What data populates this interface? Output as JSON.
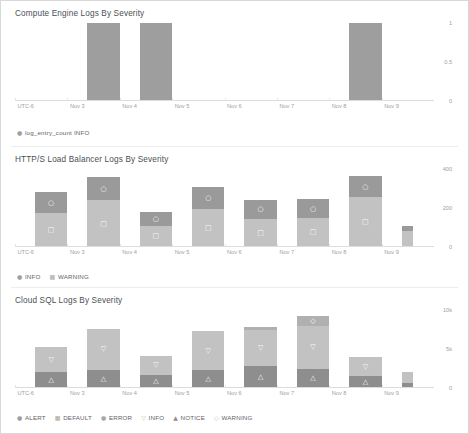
{
  "panels": [
    {
      "title": "Compute Engine Logs By Severity",
      "legend": [
        {
          "label": "log_entry_count INFO",
          "glyph": "●",
          "color": "#9e9e9e"
        }
      ],
      "chart_data": {
        "type": "bar",
        "title": "Compute Engine Logs By Severity",
        "xlabel": "",
        "ylabel": "",
        "grid": false,
        "legend_position": "bottom-left",
        "stacked": false,
        "categories": [
          "UTC-6",
          "Nov 3",
          "Nov 4",
          "Nov 5",
          "Nov 6",
          "Nov 7",
          "Nov 8",
          "Nov 9"
        ],
        "xticklabels": [
          "UTC-6",
          "Nov 3",
          "Nov 4",
          "Nov 5",
          "Nov 6",
          "Nov 7",
          "Nov 8",
          "Nov 9"
        ],
        "yticklabels": [
          "1",
          "0.5",
          "0"
        ],
        "ylim": [
          0,
          1
        ],
        "series": [
          {
            "name": "log_entry_count INFO",
            "color": "#9e9e9e",
            "values": [
              0,
              1,
              1,
              0,
              0,
              0,
              1,
              0
            ]
          }
        ]
      }
    },
    {
      "title": "HTTP/S Load Balancer Logs By Severity",
      "legend": [
        {
          "label": "INFO",
          "glyph": "●",
          "color": "#9e9e9e"
        },
        {
          "label": "WARNING",
          "glyph": "■",
          "color": "#bdbdbd"
        }
      ],
      "chart_data": {
        "type": "bar",
        "title": "HTTP/S Load Balancer Logs By Severity",
        "xlabel": "",
        "ylabel": "",
        "grid": false,
        "stacked": true,
        "legend_position": "bottom-left",
        "categories": [
          "UTC-6",
          "Nov 3",
          "Nov 4",
          "Nov 5",
          "Nov 6",
          "Nov 7",
          "Nov 8",
          "Nov 9"
        ],
        "xticklabels": [
          "UTC-6",
          "Nov 3",
          "Nov 4",
          "Nov 5",
          "Nov 6",
          "Nov 7",
          "Nov 8",
          "Nov 9"
        ],
        "yticklabels": [
          "400",
          "200",
          "0"
        ],
        "ylim": [
          0,
          400
        ],
        "series": [
          {
            "name": "INFO",
            "color": "#c2c2c2",
            "marker": "□",
            "values": [
              175,
              240,
              110,
              195,
              145,
              150,
              255,
              80
            ]
          },
          {
            "name": "WARNING",
            "color": "#9a9a9a",
            "marker": "○",
            "values": [
              105,
              120,
              70,
              115,
              95,
              95,
              110,
              30
            ]
          }
        ]
      }
    },
    {
      "title": "Cloud SQL Logs By Severity",
      "legend": [
        {
          "label": "ALERT",
          "glyph": "●",
          "color": "#9e9e9e"
        },
        {
          "label": "DEFAULT",
          "glyph": "■",
          "color": "#bdbdbd"
        },
        {
          "label": "ERROR",
          "glyph": "●",
          "color": "#a8a8a8"
        },
        {
          "label": "INFO",
          "glyph": "▽",
          "color": "#c2c2c2"
        },
        {
          "label": "NOTICE",
          "glyph": "▲",
          "color": "#8e8e8e"
        },
        {
          "label": "WARNING",
          "glyph": "◇",
          "color": "#b0b0b0"
        }
      ],
      "chart_data": {
        "type": "bar",
        "title": "Cloud SQL Logs By Severity",
        "xlabel": "",
        "ylabel": "",
        "grid": false,
        "stacked": true,
        "legend_position": "bottom-left",
        "categories": [
          "UTC-6",
          "Nov 3",
          "Nov 4",
          "Nov 5",
          "Nov 6",
          "Nov 7",
          "Nov 8",
          "Nov 9"
        ],
        "xticklabels": [
          "UTC-6",
          "Nov 3",
          "Nov 4",
          "Nov 5",
          "Nov 6",
          "Nov 7",
          "Nov 8",
          "Nov 9"
        ],
        "yticklabels": [
          "10k",
          "5k",
          "0"
        ],
        "ylim": [
          0,
          10000
        ],
        "series": [
          {
            "name": "NOTICE",
            "color": "#8e8e8e",
            "marker": "△",
            "values": [
              2000,
              2300,
              1700,
              2300,
              2800,
              2500,
              1500,
              700
            ]
          },
          {
            "name": "INFO",
            "color": "#c2c2c2",
            "marker": "▽",
            "values": [
              3300,
              5300,
              2400,
              5000,
              4700,
              5400,
              2500,
              1300
            ]
          },
          {
            "name": "WARNING",
            "color": "#b0b0b0",
            "marker": "◇",
            "values": [
              0,
              0,
              0,
              0,
              300,
              1300,
              0,
              0
            ]
          }
        ]
      }
    }
  ]
}
